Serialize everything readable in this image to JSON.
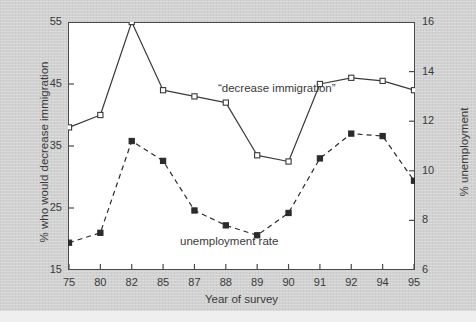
{
  "chart_data": {
    "type": "line",
    "title": "",
    "xlabel": "Year of survey",
    "ylabel": "% who would decrease immigration",
    "ylabel_right": "% unemployment",
    "categories": [
      "75",
      "80",
      "82",
      "85",
      "87",
      "88",
      "89",
      "90",
      "91",
      "92",
      "94",
      "95"
    ],
    "xtick_labels": [
      "75",
      "80",
      "82",
      "85",
      "87",
      "88",
      "89",
      "90",
      "91",
      "92",
      "94",
      "95"
    ],
    "ylim": [
      15,
      55
    ],
    "ytick_labels": [
      "15",
      "25",
      "35",
      "45",
      "55"
    ],
    "ytick_values": [
      15,
      25,
      35,
      45,
      55
    ],
    "ylim_right": [
      6,
      16
    ],
    "ytick_labels_right": [
      "6",
      "8",
      "10",
      "12",
      "14",
      "16"
    ],
    "ytick_values_right": [
      6,
      8,
      10,
      12,
      14,
      16
    ],
    "grid": false,
    "legend_position": "inline-annotation",
    "series": [
      {
        "name": "“decrease immigration”",
        "axis": "left",
        "marker": "open-square",
        "linestyle": "solid",
        "color": "#3a3a3a",
        "values": [
          38,
          40,
          55,
          44,
          43,
          42,
          33.5,
          32.5,
          45,
          46,
          45.5,
          44
        ]
      },
      {
        "name": "unemployment rate",
        "axis": "right",
        "marker": "filled-square",
        "linestyle": "dashed",
        "color": "#2b2b2b",
        "values": [
          7.1,
          7.5,
          11.2,
          10.4,
          8.4,
          7.8,
          7.4,
          8.3,
          10.5,
          11.5,
          11.4,
          9.6
        ]
      }
    ],
    "annotations": [
      {
        "text": "“decrease immigration”",
        "x_px": 218,
        "y_px": 82
      },
      {
        "text": "unemployment rate",
        "x_px": 180,
        "y_px": 235
      }
    ]
  },
  "colors": {
    "background": "#d2d2d2",
    "plot_background": "#ffffff",
    "axis": "#4a4a4a",
    "text": "#3a3a3a",
    "series_primary": "#3a3a3a",
    "series_secondary": "#2b2b2b"
  }
}
